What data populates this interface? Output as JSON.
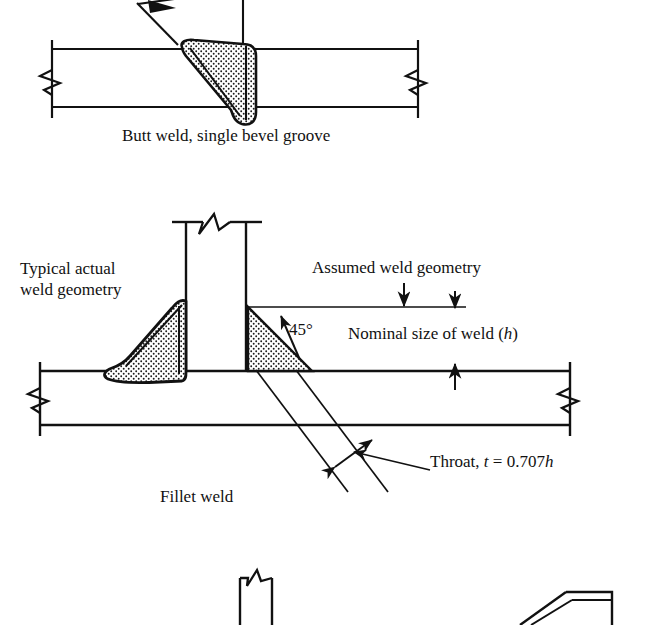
{
  "figure": {
    "line_color": "#111111",
    "fill_pattern_color": "#111111",
    "background": "#ffffff"
  },
  "diagram1": {
    "name": "butt-weld-diagram",
    "caption": "Butt weld, single bevel groove"
  },
  "diagram2": {
    "name": "fillet-weld-diagram",
    "caption": "Fillet weld",
    "labels": {
      "typical_actual_line1": "Typical actual",
      "typical_actual_line2": "weld geometry",
      "assumed_geometry": "Assumed weld geometry",
      "angle": "45°",
      "nominal_size_pre": "Nominal size of weld (",
      "nominal_size_var": "h",
      "nominal_size_post": ")",
      "throat_pre": "Throat, ",
      "throat_var_t": "t",
      "throat_eq": " = 0.707",
      "throat_var_h": "h"
    }
  },
  "diagram3": {
    "name": "partial-weld-diagram-bottom",
    "caption": ""
  }
}
